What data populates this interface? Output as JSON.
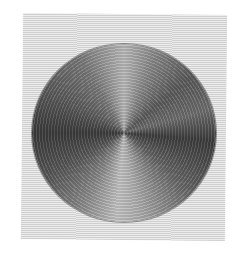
{
  "image": {
    "subject": "woven circular placemat",
    "colors": {
      "background_light": "#ececec",
      "background_line": "#cfcfcf",
      "disc_dark": "#3c3c3c",
      "disc_light": "#c6c6c6"
    }
  }
}
